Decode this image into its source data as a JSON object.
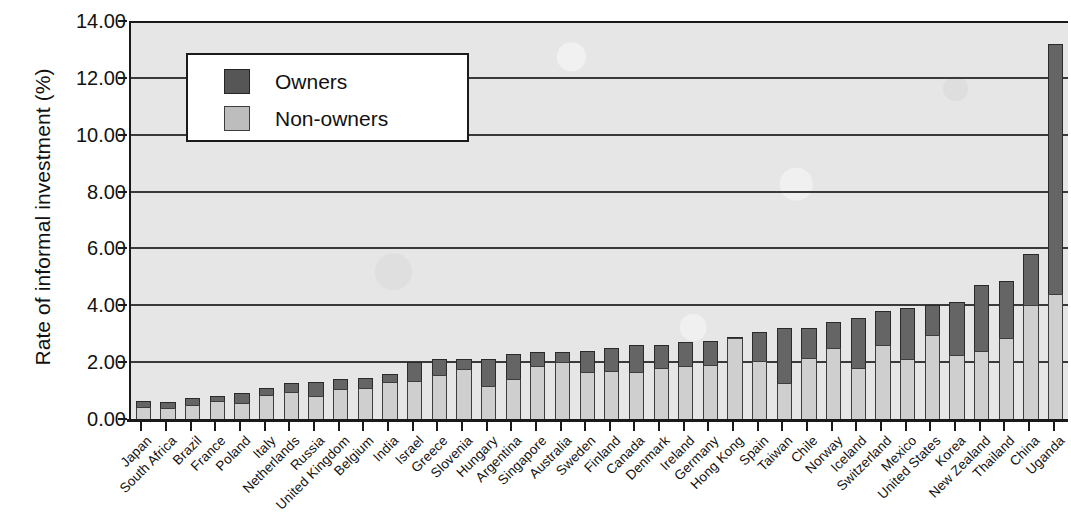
{
  "chart_data": {
    "type": "bar",
    "stacked": true,
    "title": "",
    "xlabel": "",
    "ylabel": "Rate of informal investment (%)",
    "ylim": [
      0,
      14
    ],
    "ytick_values": [
      0,
      2,
      4,
      6,
      8,
      10,
      12,
      14
    ],
    "ytick_labels": [
      "0.00",
      "2.00",
      "4.00",
      "6.00",
      "8.00",
      "10.00",
      "12.00",
      "14.00"
    ],
    "grid": true,
    "legend_position": "upper-left-inset",
    "categories": [
      "Japan",
      "South Africa",
      "Brazil",
      "France",
      "Poland",
      "Italy",
      "Netherlands",
      "Russia",
      "United Kingdom",
      "Belgium",
      "India",
      "Israel",
      "Greece",
      "Slovenia",
      "Hungary",
      "Argentina",
      "Singapore",
      "Australia",
      "Sweden",
      "Finland",
      "Canada",
      "Denmark",
      "Ireland",
      "Germany",
      "Hong Kong",
      "Spain",
      "Taiwan",
      "Chile",
      "Norway",
      "Iceland",
      "Switzerland",
      "Mexico",
      "United States",
      "Korea",
      "New Zealand",
      "Thailand",
      "China",
      "Uganda"
    ],
    "series": [
      {
        "name": "Non-owners",
        "color": "#cfcfcf",
        "values": [
          0.42,
          0.38,
          0.5,
          0.62,
          0.55,
          0.85,
          0.95,
          0.8,
          1.05,
          1.1,
          1.3,
          1.35,
          1.55,
          1.75,
          1.15,
          1.4,
          1.85,
          2.0,
          1.65,
          1.7,
          1.65,
          1.8,
          1.85,
          1.9,
          2.85,
          2.05,
          1.25,
          2.15,
          2.5,
          1.8,
          2.6,
          2.1,
          2.95,
          2.25,
          2.4,
          2.85,
          4.0,
          4.4
        ]
      },
      {
        "name": "Owners",
        "color": "#656565",
        "values": [
          0.23,
          0.22,
          0.25,
          0.18,
          0.35,
          0.25,
          0.3,
          0.5,
          0.35,
          0.35,
          0.3,
          0.65,
          0.55,
          0.35,
          0.95,
          0.9,
          0.5,
          0.35,
          0.75,
          0.8,
          0.95,
          0.8,
          0.85,
          0.85,
          0.05,
          1.0,
          1.95,
          1.05,
          0.9,
          1.75,
          1.2,
          1.8,
          1.05,
          1.85,
          2.3,
          2.0,
          1.8,
          8.8
        ]
      }
    ],
    "totals": [
      0.65,
      0.6,
      0.75,
      0.8,
      0.9,
      1.1,
      1.25,
      1.3,
      1.4,
      1.45,
      1.6,
      2.0,
      2.1,
      2.1,
      2.1,
      2.3,
      2.35,
      2.35,
      2.4,
      2.5,
      2.6,
      2.6,
      2.7,
      2.75,
      2.9,
      3.05,
      3.2,
      3.2,
      3.4,
      3.55,
      3.8,
      3.9,
      4.0,
      4.1,
      4.7,
      4.85,
      5.8,
      13.2
    ]
  },
  "legend": {
    "items": [
      {
        "label": "Owners",
        "swatch": "owners"
      },
      {
        "label": "Non-owners",
        "swatch": "nonowners"
      }
    ]
  }
}
